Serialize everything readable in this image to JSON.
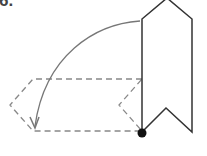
{
  "figure": {
    "label": "6.",
    "colors": {
      "banner_stroke": "#333333",
      "dashed_stroke": "#888888",
      "arrow": "#777777",
      "pivot": "#111111",
      "background": "#ffffff"
    }
  }
}
